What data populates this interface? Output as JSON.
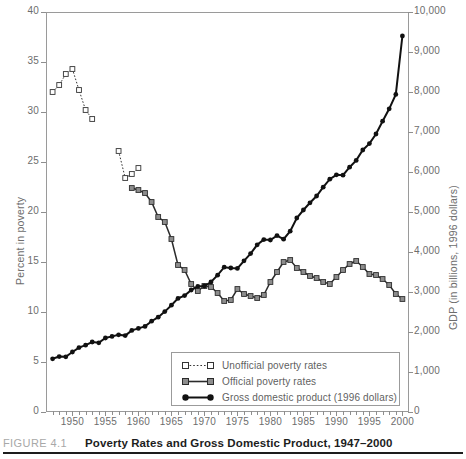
{
  "caption": {
    "number": "FIGURE 4.1",
    "title": "Poverty Rates and Gross Domestic Product, 1947–2000"
  },
  "legend": {
    "items": [
      {
        "key": "open-square-dotted",
        "label": "Unofficial poverty rates"
      },
      {
        "key": "gray-square-solid",
        "label": "Official poverty rates"
      },
      {
        "key": "filled-circle-solid",
        "label": "Gross domestic product (1996 dollars)"
      }
    ]
  },
  "chart_data": {
    "type": "line",
    "title": "Poverty Rates and Gross Domestic Product, 1947–2000",
    "xlabel": "",
    "ylabel": "Percent in poverty",
    "y2label": "GDP (in billions, 1996 dollars)",
    "xlim": [
      1946,
      2001
    ],
    "ylim": [
      0,
      40
    ],
    "y2lim": [
      0,
      10000
    ],
    "grid": false,
    "legend_position": "inside-bottom-center",
    "xticks_major": [
      1950,
      1955,
      1960,
      1965,
      1970,
      1975,
      1980,
      1985,
      1990,
      1995,
      2000
    ],
    "xticks_minor_every": 1,
    "yticks_left": [
      0,
      5,
      10,
      15,
      20,
      25,
      30,
      35,
      40
    ],
    "ytick_left_labels": [
      "0",
      "5",
      "10",
      "15",
      "20",
      "25",
      "30",
      "35",
      "40"
    ],
    "yticks_right": [
      0,
      1000,
      2000,
      3000,
      4000,
      5000,
      6000,
      7000,
      8000,
      9000,
      10000
    ],
    "ytick_right_labels": [
      "0",
      "1,000",
      "2,000",
      "3,000",
      "4,000",
      "5,000",
      "6,000",
      "7,000",
      "8,000",
      "9,000",
      "10,000"
    ],
    "series": [
      {
        "name": "Unofficial poverty rates",
        "axis": "left",
        "style": "dotted",
        "marker": "open-square",
        "color": "#333333",
        "segments": [
          {
            "x": [
              1947,
              1948,
              1949,
              1950,
              1951,
              1952,
              1953
            ],
            "y": [
              32.0,
              32.7,
              33.8,
              34.3,
              32.2,
              30.2,
              29.3
            ]
          },
          {
            "x": [
              1957,
              1958,
              1959,
              1960
            ],
            "y": [
              26.1,
              23.4,
              23.8,
              24.4
            ]
          }
        ]
      },
      {
        "name": "Official poverty rates",
        "axis": "left",
        "style": "solid",
        "marker": "gray-square",
        "color": "#2b2b2b",
        "x": [
          1959,
          1960,
          1961,
          1962,
          1963,
          1964,
          1965,
          1966,
          1967,
          1968,
          1969,
          1970,
          1971,
          1972,
          1973,
          1974,
          1975,
          1976,
          1977,
          1978,
          1979,
          1980,
          1981,
          1982,
          1983,
          1984,
          1985,
          1986,
          1987,
          1988,
          1989,
          1990,
          1991,
          1992,
          1993,
          1994,
          1995,
          1996,
          1997,
          1998,
          1999,
          2000
        ],
        "y": [
          22.4,
          22.2,
          21.9,
          21.0,
          19.5,
          19.0,
          17.3,
          14.7,
          14.2,
          12.8,
          12.1,
          12.6,
          12.5,
          11.9,
          11.1,
          11.2,
          12.3,
          11.8,
          11.6,
          11.4,
          11.7,
          13.0,
          14.0,
          15.0,
          15.2,
          14.4,
          14.0,
          13.6,
          13.4,
          13.0,
          12.8,
          13.5,
          14.2,
          14.8,
          15.1,
          14.5,
          13.8,
          13.7,
          13.3,
          12.7,
          11.8,
          11.3
        ]
      },
      {
        "name": "Gross domestic product (1996 dollars)",
        "axis": "right",
        "style": "solid",
        "marker": "filled-circle",
        "color": "#111111",
        "x": [
          1947,
          1948,
          1949,
          1950,
          1951,
          1952,
          1953,
          1954,
          1955,
          1956,
          1957,
          1958,
          1959,
          1960,
          1961,
          1962,
          1963,
          1964,
          1965,
          1966,
          1967,
          1968,
          1969,
          1970,
          1971,
          1972,
          1973,
          1974,
          1975,
          1976,
          1977,
          1978,
          1979,
          1980,
          1981,
          1982,
          1983,
          1984,
          1985,
          1986,
          1987,
          1988,
          1989,
          1990,
          1991,
          1992,
          1993,
          1994,
          1995,
          1996,
          1997,
          1998,
          1999,
          2000
        ],
        "y": [
          1330,
          1385,
          1380,
          1500,
          1610,
          1670,
          1750,
          1730,
          1850,
          1890,
          1930,
          1910,
          2040,
          2090,
          2140,
          2270,
          2370,
          2510,
          2670,
          2840,
          2910,
          3050,
          3140,
          3150,
          3250,
          3420,
          3620,
          3600,
          3590,
          3780,
          3960,
          4180,
          4310,
          4300,
          4410,
          4320,
          4520,
          4850,
          5050,
          5230,
          5400,
          5620,
          5820,
          5930,
          5920,
          6120,
          6290,
          6550,
          6710,
          6950,
          7270,
          7580,
          7940,
          9400
        ]
      }
    ]
  }
}
